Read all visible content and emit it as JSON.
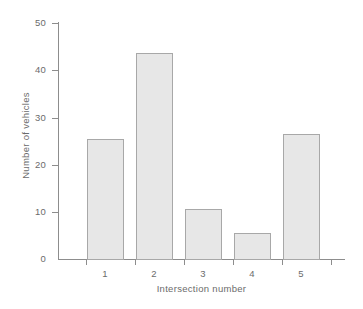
{
  "chart_data": {
    "type": "bar",
    "title": "",
    "subtitle": "",
    "xlabel": "Intersection number",
    "ylabel": "Number of vehicles",
    "categories": [
      "1",
      "2",
      "3",
      "4",
      "5"
    ],
    "values": [
      25.4,
      43.7,
      10.5,
      5.5,
      26.5
    ],
    "series": [
      {
        "name": "Number of vehicles",
        "values": [
          25.4,
          43.7,
          10.5,
          5.5,
          26.5
        ]
      }
    ],
    "ylim": [
      0,
      50
    ],
    "ytick_labels": [
      "0",
      "10",
      "20",
      "30",
      "40",
      "50"
    ],
    "ytick_values": [
      0,
      10,
      20,
      30,
      40,
      50
    ],
    "xtick_labels": [
      "1",
      "2",
      "3",
      "4",
      "5"
    ],
    "grid": false,
    "legend": false,
    "legend_position": "none",
    "colors": {
      "bar_fill": "#e7e7e7",
      "bar_edge": "#a8a8a8",
      "axis": "#8d8d8d",
      "text": "#6b6b6b",
      "background": "#ffffff"
    }
  }
}
